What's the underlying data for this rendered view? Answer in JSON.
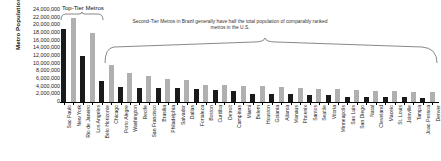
{
  "chart_data": {
    "type": "bar",
    "title": "",
    "xlabel": "",
    "ylabel": "Metro Population",
    "ylim": [
      0,
      24000000
    ],
    "grid": false,
    "legend": null,
    "yticks": [
      "24,000,000",
      "22,000,000",
      "20,000,000",
      "18,000,000",
      "16,000,000",
      "14,000,000",
      "12,000,000",
      "10,000,000",
      "8,000,000",
      "6,000,000",
      "4,000,000",
      "2,000,000",
      "0"
    ],
    "ytick_values": [
      24000000,
      22000000,
      20000000,
      18000000,
      16000000,
      14000000,
      12000000,
      10000000,
      8000000,
      6000000,
      4000000,
      2000000,
      0
    ],
    "country_colors": {
      "Brazil": "#1a1a1a",
      "United States": "#b0b0b0"
    },
    "categories": [
      "Sao Paulo",
      "New York",
      "Rio de Janeiro",
      "Los Angeles",
      "Belo Horizonte",
      "Chicago",
      "Porto Alegre",
      "Washington",
      "Recife",
      "San Francisco",
      "Brasilia",
      "Philadelphia",
      "Salvador",
      "Dallas",
      "Fortaleza",
      "Boston",
      "Curitiba",
      "Detroit",
      "Campinas",
      "Miami",
      "Belem",
      "Houston",
      "Goiania",
      "Atlanta",
      "Manaus",
      "Phoenix",
      "Santos",
      "Seattle",
      "Vitoria",
      "Minneapolis",
      "Sao Luis",
      "San Diego",
      "Natal",
      "Cleveland",
      "Maceio",
      "St. Louis",
      "Joinville",
      "Tampa",
      "Joao Pessoa",
      "Denver"
    ],
    "countries": [
      "Brazil",
      "United States",
      "Brazil",
      "United States",
      "Brazil",
      "United States",
      "Brazil",
      "United States",
      "Brazil",
      "United States",
      "Brazil",
      "United States",
      "Brazil",
      "United States",
      "Brazil",
      "United States",
      "Brazil",
      "United States",
      "Brazil",
      "United States",
      "Brazil",
      "United States",
      "Brazil",
      "United States",
      "Brazil",
      "United States",
      "Brazil",
      "United States",
      "Brazil",
      "United States",
      "Brazil",
      "United States",
      "Brazil",
      "United States",
      "Brazil",
      "United States",
      "Brazil",
      "United States",
      "Brazil",
      "United States"
    ],
    "values": [
      19000000,
      22000000,
      12000000,
      18000000,
      5500000,
      9600000,
      4000000,
      7600000,
      3700000,
      6800000,
      3600000,
      6000000,
      3600000,
      5700000,
      3500000,
      4500000,
      3200000,
      4400000,
      2800000,
      4300000,
      2200000,
      4200000,
      2100000,
      4000000,
      2000000,
      3600000,
      1800000,
      3300000,
      1700000,
      3300000,
      1400000,
      3100000,
      1350000,
      3000000,
      1250000,
      2800000,
      1200000,
      2700000,
      1150000,
      2600000
    ],
    "annotations": [
      {
        "id": "top-tier",
        "text": "Top-Tier Metros",
        "spans": [
          "Sao Paulo",
          "Los Angeles"
        ]
      },
      {
        "id": "second-tier",
        "text": "Second-Tier Metros in Brazil generally have half the total population of comparably ranked metros in the U.S.",
        "spans": [
          "Belo Horizonte",
          "Denver"
        ]
      }
    ]
  }
}
